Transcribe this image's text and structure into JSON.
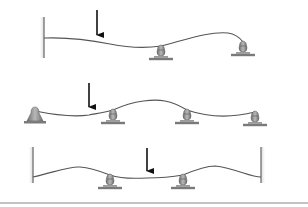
{
  "diagram": {
    "type": "continuous-beam-deflection",
    "colors": {
      "beam": "#555555",
      "arrow": "#111111",
      "wall": "#8a8a8a",
      "support_body": "#9a9a9a",
      "support_base": "#7a7a7a",
      "bottom_rule": "#888888"
    },
    "panels": [
      {
        "name": "beam-1",
        "description": "Cantilever fixed at left wall, two roller supports, point load",
        "walls": [
          {
            "x": 44,
            "y1": 17,
            "y2": 58
          }
        ],
        "beam_path": "M44,38 C70,37 90,40 110,44 C130,48 148,48 161,46 C185,40 210,31 228,33 C236,34 240,38 243,42",
        "load": {
          "x": 97,
          "y1": 10,
          "y2": 42
        },
        "supports": [
          {
            "x": 161,
            "y": 46,
            "kind": "roller"
          },
          {
            "x": 243,
            "y": 42,
            "kind": "roller"
          }
        ]
      },
      {
        "name": "beam-2",
        "description": "Pinned left end, three roller supports, point load",
        "walls": [],
        "beam_path": "M35,111 C55,115 75,117 89,115 C100,113 107,112 113,110 C135,100 155,99 165,101 C175,103 182,107 187,110 C210,118 235,117 255,112",
        "load": {
          "x": 89,
          "y1": 83,
          "y2": 114
        },
        "supports": [
          {
            "x": 35,
            "y": 111,
            "kind": "pin"
          },
          {
            "x": 113,
            "y": 110,
            "kind": "roller"
          },
          {
            "x": 187,
            "y": 110,
            "kind": "roller"
          },
          {
            "x": 255,
            "y": 112,
            "kind": "roller"
          }
        ]
      },
      {
        "name": "beam-3",
        "description": "Fixed at both walls, two roller supports, central point load",
        "walls": [
          {
            "x": 33,
            "y1": 147,
            "y2": 183
          },
          {
            "x": 261,
            "y1": 147,
            "y2": 183
          }
        ],
        "beam_path": "M33,177 C55,172 70,166 80,167 C92,168 102,172 110,175 C125,180 138,178 147,178 C160,178 172,177 183,175 C195,170 205,166 215,166 C235,168 250,177 261,177",
        "load": {
          "x": 147,
          "y1": 148,
          "y2": 178
        },
        "supports": [
          {
            "x": 110,
            "y": 175,
            "kind": "roller"
          },
          {
            "x": 183,
            "y": 175,
            "kind": "roller"
          }
        ]
      }
    ],
    "bottom_rule": {
      "y": 203,
      "x1": 0,
      "x2": 308
    }
  }
}
